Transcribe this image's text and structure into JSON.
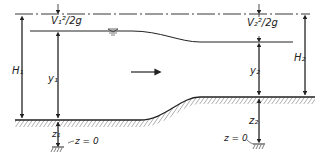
{
  "diagram": {
    "type": "open-channel flow over a raised bed (energy diagram)",
    "colors": {
      "ink": "#222222",
      "background": "#ffffff"
    },
    "labels": {
      "velocity_head_1": "V₁²/2g",
      "velocity_head_2": "V₂²/2g",
      "total_head_1": "H₁",
      "total_head_2": "H₂",
      "depth_1": "y₁",
      "depth_2": "y₂",
      "elevation_1": "z₁",
      "elevation_2": "z₂",
      "datum_1": "z = 0",
      "datum_2": "z = 0"
    },
    "elements": [
      "energy-line",
      "water-surface",
      "channel-bed",
      "flow-direction-arrow",
      "datum-symbols",
      "free-surface-symbol"
    ]
  }
}
